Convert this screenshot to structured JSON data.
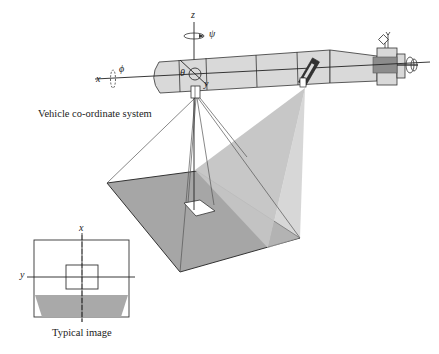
{
  "diagram": {
    "title_caption": "Vehicle co-ordinate system",
    "inset_caption": "Typical image",
    "vehicle_axes": {
      "x_label": "x",
      "y_label": "y",
      "z_label": "z",
      "roll_label": "ϕ",
      "pitch_label": "θ",
      "yaw_label": "ψ"
    },
    "inset_axes": {
      "x_label": "x",
      "y_label": "y"
    },
    "components": [
      "vehicle-body",
      "downward-camera",
      "forward-camera",
      "ground-plane",
      "camera-footprint",
      "forward-view-cone",
      "thruster",
      "antenna"
    ],
    "colors": {
      "vehicle_fill": "#d9d9d9",
      "ground_fill": "#a6a6a6",
      "cone_fill": "#c4c4c4",
      "thruster_block": "#8c8c8c",
      "line": "#333333"
    }
  }
}
